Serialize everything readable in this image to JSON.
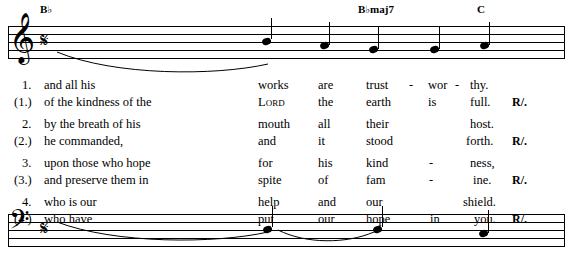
{
  "document": {
    "type": "music-score-with-verses",
    "page_mark": ""
  },
  "chords": [
    {
      "root": "B",
      "accidental": "♭",
      "quality": "",
      "x": 40,
      "y": 4
    },
    {
      "root": "B",
      "accidental": "♭",
      "quality": "maj7",
      "x": 358,
      "y": 4
    },
    {
      "root": "C",
      "accidental": "",
      "quality": "",
      "x": 476,
      "y": 4
    }
  ],
  "staves": {
    "top": {
      "clef": "treble-clef",
      "meter": "cut-time",
      "y": 20
    },
    "bottom": {
      "clef": "bass-clef",
      "meter": "cut-time",
      "y": 208
    }
  },
  "verses": [
    {
      "number": "1.",
      "words": [
        "and all his",
        "works",
        "are",
        "trust",
        "-",
        "wor",
        "-",
        "thy.",
        ""
      ]
    },
    {
      "number": "(1.)",
      "words": [
        "of the kindness of the",
        "Lord",
        "the",
        "earth",
        "",
        "is",
        "",
        "full.",
        "R/."
      ]
    },
    {
      "number": "2.",
      "words": [
        "by the breath of his",
        "mouth",
        "all",
        "their",
        "",
        "",
        "",
        "host.",
        ""
      ]
    },
    {
      "number": "(2.)",
      "words": [
        "he commanded,",
        "and",
        "it",
        "stood",
        "",
        "",
        "",
        "forth.",
        "R/."
      ]
    },
    {
      "number": "3.",
      "words": [
        "upon those who hope",
        "for",
        "his",
        "kind",
        "-",
        "",
        "",
        "ness,",
        ""
      ]
    },
    {
      "number": "(3.)",
      "words": [
        "and preserve them in",
        "spite",
        "of",
        "fam",
        "-",
        "",
        "",
        "ine.",
        "R/."
      ]
    },
    {
      "number": "4.",
      "words": [
        "who is our",
        "help",
        "and",
        "our",
        "",
        "",
        "",
        "shield.",
        ""
      ]
    },
    {
      "number": "(4.)",
      "words": [
        "who have",
        "put",
        "our",
        "hope",
        "in",
        "",
        "",
        "you.",
        "R/."
      ]
    }
  ],
  "columns": {
    "num_x": 22,
    "text_x": 44,
    "c1_x": 258,
    "c2_x": 318,
    "c3_x": 366,
    "dash1_x": 410,
    "c4_x": 430,
    "dash2_x": 455,
    "c5_right": 505,
    "resp_x": 512
  },
  "colors": {
    "ink": "#000000",
    "paper": "#ffffff"
  }
}
